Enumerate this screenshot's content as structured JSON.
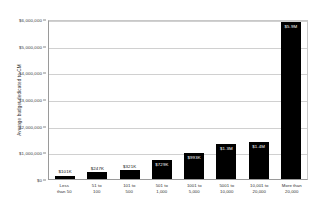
{
  "chart_data": {
    "type": "bar",
    "title": "",
    "subtitle": "",
    "xlabel": "",
    "ylabel": "Average budget dedicated to CM",
    "ylim": [
      0,
      6000000
    ],
    "ytick_step": 1000000,
    "grid": true,
    "legend": false,
    "bar_color": "#000000",
    "plot_background": "#ffffff",
    "gridline_color": "#d0d0d0",
    "categories": [
      "Less than 50",
      "51 to 100",
      "101 to 500",
      "501 to 1,000",
      "1001 to 5,000",
      "5001 to 10,000",
      "10,001 to 20,000",
      "More than 20,000"
    ],
    "category_lines": [
      [
        "Less",
        "than 50"
      ],
      [
        "51 to",
        "100"
      ],
      [
        "101 to",
        "500"
      ],
      [
        "501 to",
        "1,000"
      ],
      [
        "1001 to",
        "5,000"
      ],
      [
        "5001 to",
        "10,000"
      ],
      [
        "10,001 to",
        "20,000"
      ],
      [
        "More than",
        "20,000"
      ]
    ],
    "values": [
      101000,
      247000,
      321000,
      729000,
      993000,
      1300000,
      1400000,
      5900000
    ],
    "data_labels": [
      "$101K",
      "$247K",
      "$321K",
      "$729K",
      "$993K",
      "$1.3M",
      "$1.4M",
      "$5.9M"
    ],
    "label_placement": [
      "outside",
      "outside",
      "outside",
      "inside",
      "inside",
      "inside",
      "inside",
      "inside"
    ],
    "yticks": [
      {
        "value": 6000000,
        "label": "$6,000,000"
      },
      {
        "value": 5000000,
        "label": "$5,000,000"
      },
      {
        "value": 4000000,
        "label": "$4,000,000"
      },
      {
        "value": 3000000,
        "label": "$3,000,000"
      },
      {
        "value": 2000000,
        "label": "$2,000,000"
      },
      {
        "value": 1000000,
        "label": "$1,000,000"
      },
      {
        "value": 0,
        "label": "$0"
      }
    ]
  }
}
